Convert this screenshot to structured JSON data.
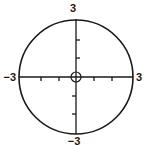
{
  "diagram": {
    "type": "circle-on-coordinate-axes",
    "stroke_color": "#1a1a1a",
    "background": "#ffffff",
    "circle": {
      "center": [
        0,
        0
      ],
      "radius": 3
    },
    "origin_marker": "open-circle",
    "axes": {
      "x": {
        "min": -3,
        "max": 3,
        "ticks": [
          -2,
          -1,
          1,
          2
        ],
        "tick_direction": "down"
      },
      "y": {
        "min": -3,
        "max": 3,
        "ticks": [
          -2,
          -1,
          1,
          2
        ],
        "tick_direction_upper": "right",
        "tick_direction_lower": "left"
      }
    },
    "labels": {
      "top": "3",
      "bottom": "−3",
      "left": "−3",
      "right": "3"
    }
  }
}
